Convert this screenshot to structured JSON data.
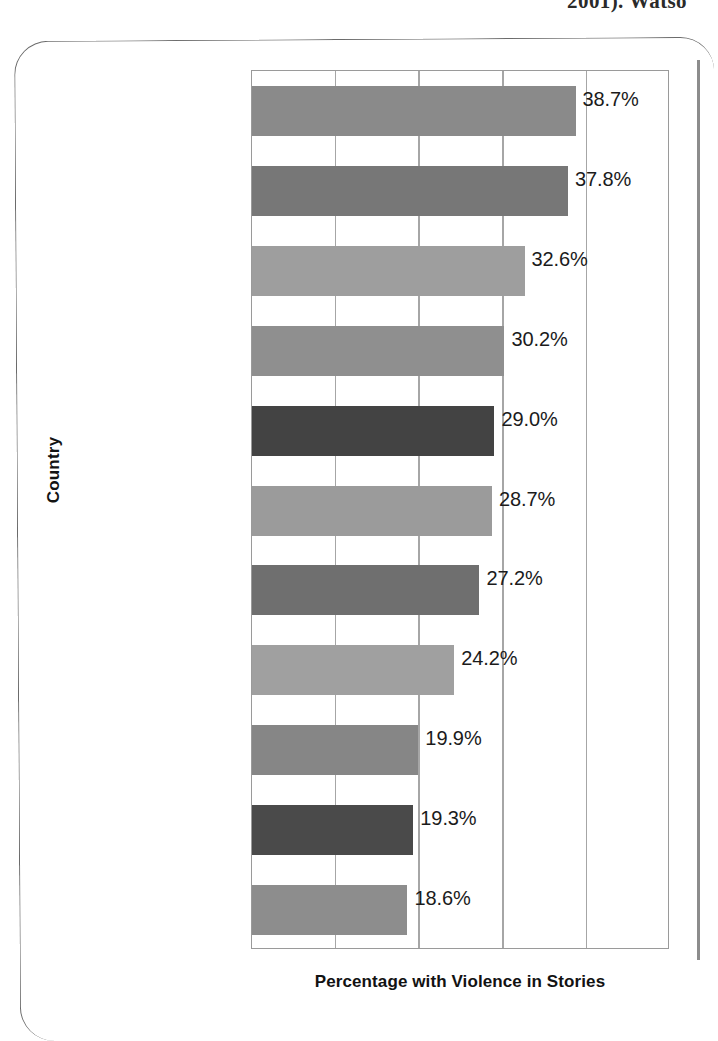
{
  "page": {
    "cutoff_header_text": "2001). Watso"
  },
  "chart_data": {
    "type": "bar",
    "orientation": "horizontal",
    "title": "",
    "xlabel": "Percentage with Violence in Stories",
    "ylabel": "Country",
    "categories": [
      "New Zealand",
      "Australia",
      "Northern Ireland",
      "United States",
      "Japan",
      "England",
      "Canada",
      "France",
      "Mexico",
      "Sweden",
      "Korea"
    ],
    "values": [
      38.7,
      37.8,
      32.6,
      30.2,
      29.0,
      28.7,
      27.2,
      24.2,
      19.9,
      19.3,
      18.6
    ],
    "value_labels": [
      "38.7%",
      "37.8%",
      "32.6%",
      "30.2%",
      "29.0%",
      "28.7%",
      "27.2%",
      "24.2%",
      "19.9%",
      "19.3%",
      "18.6%"
    ],
    "bar_colors": [
      "#8a8a8a",
      "#777777",
      "#9e9e9e",
      "#8f8f8f",
      "#434343",
      "#9b9b9b",
      "#6f6f6f",
      "#a0a0a0",
      "#868686",
      "#4a4a4a",
      "#8d8d8d"
    ],
    "xlim": [
      0,
      50
    ],
    "x_tick_labels": [],
    "gridlines": [
      0,
      10,
      20,
      30,
      40,
      50
    ],
    "grid": true,
    "legend": "none",
    "axis_color": "#9a9a9a"
  }
}
